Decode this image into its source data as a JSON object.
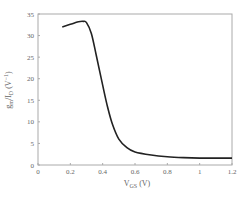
{
  "chart_data": {
    "type": "line",
    "title": "",
    "xlabel": "V_GS (V)",
    "ylabel": "g_m / I_D (V^-1)",
    "xlim": [
      0,
      1.2
    ],
    "ylim": [
      0,
      35
    ],
    "xticks": [
      "0",
      "0.2",
      "0.4",
      "0.6",
      "0.8",
      "1",
      "1.2"
    ],
    "yticks": [
      "0",
      "5",
      "10",
      "15",
      "20",
      "25",
      "30",
      "35"
    ],
    "grid": false,
    "legend": null,
    "series": [
      {
        "name": "gm/ID",
        "x": [
          0.15,
          0.2,
          0.25,
          0.28,
          0.3,
          0.33,
          0.36,
          0.4,
          0.43,
          0.46,
          0.5,
          0.55,
          0.6,
          0.7,
          0.8,
          0.9,
          1.0,
          1.1,
          1.2
        ],
        "y": [
          32,
          32.6,
          33.2,
          33.3,
          33,
          30.5,
          25.5,
          18.5,
          13.5,
          9.5,
          6,
          4,
          3,
          2.3,
          1.9,
          1.7,
          1.6,
          1.6,
          1.6
        ]
      }
    ]
  },
  "labels": {
    "xlabel_main": "V",
    "xlabel_sub": "GS",
    "xlabel_unit": " (V)",
    "ylabel_g": "g",
    "ylabel_m": "m",
    "ylabel_mid": "/I",
    "ylabel_D": "D",
    "ylabel_unit": " (V",
    "ylabel_exp": "−1",
    "ylabel_close": ")"
  }
}
